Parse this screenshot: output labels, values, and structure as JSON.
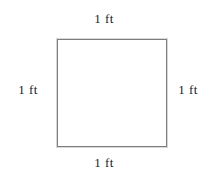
{
  "figure": {
    "shape": "square",
    "line_color": "#7d7d7d",
    "line_width_px": 2,
    "fill_color": "#ffffff",
    "background_color": "#ffffff",
    "text_color": "#1c1c1c",
    "labels": {
      "top": "1 ft",
      "right": "1 ft",
      "bottom": "1 ft",
      "left": "1 ft"
    }
  }
}
